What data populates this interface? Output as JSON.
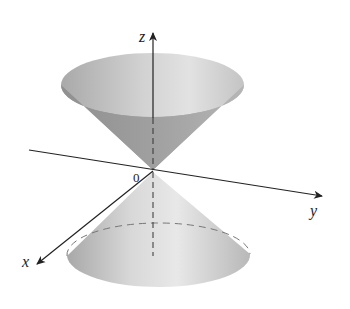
{
  "figure": {
    "axes": {
      "x_label": "x",
      "y_label": "y",
      "z_label": "z",
      "origin_label": "0"
    },
    "colors": {
      "cone_light": "#e6e6e6",
      "cone_mid": "#bdbdbd",
      "cone_dark": "#8f8f8f",
      "axis": "#222222"
    }
  }
}
